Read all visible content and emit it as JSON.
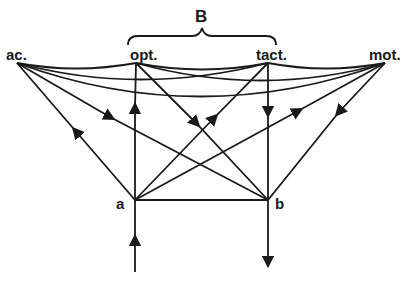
{
  "diagram": {
    "group_label": "B",
    "nodes": [
      {
        "id": "ac",
        "label": "ac.",
        "x": 17,
        "y": 63
      },
      {
        "id": "opt",
        "label": "opt.",
        "x": 136,
        "y": 63
      },
      {
        "id": "tact",
        "label": "tact.",
        "x": 268,
        "y": 63
      },
      {
        "id": "mot",
        "label": "mot.",
        "x": 385,
        "y": 63
      },
      {
        "id": "a",
        "label": "a",
        "x": 135,
        "y": 200
      },
      {
        "id": "b",
        "label": "b",
        "x": 268,
        "y": 200
      }
    ],
    "curved_edges": [
      {
        "from": "ac",
        "to": "opt"
      },
      {
        "from": "ac",
        "to": "tact"
      },
      {
        "from": "ac",
        "to": "mot"
      },
      {
        "from": "opt",
        "to": "tact"
      },
      {
        "from": "opt",
        "to": "mot"
      },
      {
        "from": "tact",
        "to": "mot"
      }
    ],
    "directed_edges": [
      {
        "from": "a",
        "to": "ac"
      },
      {
        "from": "ac",
        "to": "b"
      },
      {
        "from": "a",
        "to": "opt"
      },
      {
        "from": "opt",
        "to": "b"
      },
      {
        "from": "a",
        "to": "tact"
      },
      {
        "from": "tact",
        "to": "b"
      },
      {
        "from": "a",
        "to": "mot"
      },
      {
        "from": "mot",
        "to": "b"
      }
    ],
    "undirected_edges": [
      {
        "from": "a",
        "to": "b"
      }
    ],
    "input": {
      "to": "a",
      "direction": "up"
    },
    "output": {
      "from": "b",
      "direction": "down"
    },
    "colors": {
      "ink": "#1a1a1a",
      "background": "#ffffff"
    }
  }
}
